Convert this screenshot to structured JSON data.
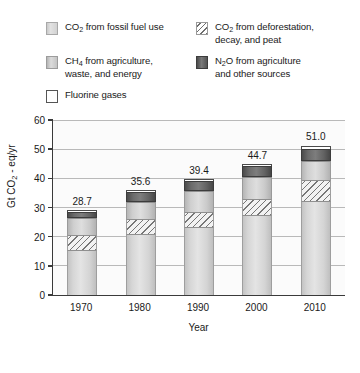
{
  "legend": {
    "entries": [
      {
        "id": "co2-fossil",
        "label": "CO2 from fossil fuel use",
        "swatch": "light-gray-solid-swatch"
      },
      {
        "id": "co2-deforest",
        "label": "CO2 from deforestation,\ndecay, and peat",
        "swatch": "diagonal-hatch-swatch"
      },
      {
        "id": "ch4",
        "label": "CH4 from agriculture,\nwaste, and energy",
        "swatch": "medium-gray-solid-swatch"
      },
      {
        "id": "n2o",
        "label": "N2O from agriculture\nand other sources",
        "swatch": "dark-gray-solid-swatch"
      },
      {
        "id": "fluorine",
        "label": "Fluorine gases",
        "swatch": "white-outline-swatch"
      }
    ]
  },
  "chart_data": {
    "type": "bar",
    "subtype": "stacked",
    "title": "",
    "xlabel": "Year",
    "ylabel": "Gt CO2 - eq/yr",
    "categories": [
      "1970",
      "1980",
      "1990",
      "2000",
      "2010"
    ],
    "ylim": [
      0,
      60
    ],
    "yticks": [
      0,
      10,
      20,
      30,
      40,
      50,
      60
    ],
    "grid": true,
    "legend_position": "above-plot",
    "totals": [
      28.7,
      35.6,
      39.4,
      44.7,
      51.0
    ],
    "total_labels": [
      "28.7",
      "35.6",
      "39.4",
      "44.7",
      "51.0"
    ],
    "series": [
      {
        "name": "CO2 from fossil fuel use",
        "values": [
          15.0,
          20.5,
          23.0,
          27.0,
          32.0
        ]
      },
      {
        "name": "CO2 from deforestation, decay, and peat",
        "values": [
          5.7,
          5.5,
          5.5,
          6.0,
          7.5
        ]
      },
      {
        "name": "CH4 from agriculture, waste, and energy",
        "values": [
          5.8,
          6.0,
          7.0,
          7.5,
          6.5
        ]
      },
      {
        "name": "N2O from agriculture and other sources",
        "values": [
          1.9,
          3.2,
          3.5,
          3.7,
          4.2
        ]
      },
      {
        "name": "Fluorine gases",
        "values": [
          0.3,
          0.4,
          0.4,
          0.5,
          0.8
        ]
      }
    ]
  }
}
